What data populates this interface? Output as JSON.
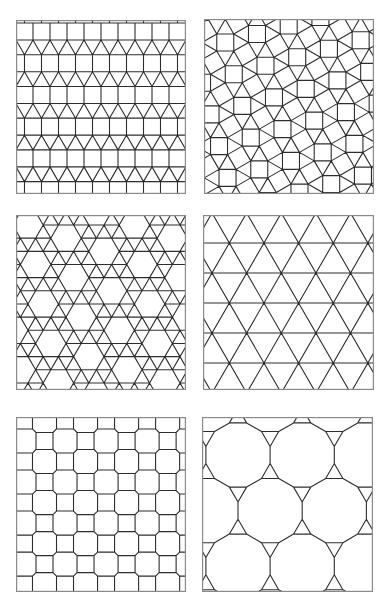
{
  "figure": {
    "background": "#ffffff",
    "line_color": "#2e2e2e",
    "frame_color": "#8a8a8a",
    "panels": [
      {
        "id": "elongated-triangular",
        "name": "Elongated triangular tiling (3.3.3.4.4)",
        "box": {
          "x": 16,
          "y": 20,
          "w": 170,
          "h": 174
        },
        "tiling": "elongated_triangular",
        "params": {
          "edge": 17,
          "origin_x": 0,
          "origin_y": 3
        }
      },
      {
        "id": "snub-square",
        "name": "Snub square tiling (3.3.4.3.4)",
        "box": {
          "x": 204,
          "y": 19,
          "w": 170,
          "h": 175
        },
        "tiling": "snub_square",
        "params": {
          "edge": 17,
          "rotation_deg": -15,
          "origin_x": 40,
          "origin_y": 42
        }
      },
      {
        "id": "snub-hexagonal",
        "name": "Snub hexagonal tiling (3.3.3.3.6)",
        "box": {
          "x": 16,
          "y": 215,
          "w": 170,
          "h": 175
        },
        "tiling": "snub_hexagonal",
        "params": {
          "edge": 15.2,
          "rotation_deg": 0,
          "origin_x": 12,
          "origin_y": 10
        }
      },
      {
        "id": "trihexagonal",
        "name": "Trihexagonal tiling (3.6.3.6)",
        "box": {
          "x": 203,
          "y": 215,
          "w": 171,
          "h": 175
        },
        "tiling": "trihexagonal",
        "params": {
          "row_spacing": 30,
          "origin_x": 9,
          "origin_y": 28
        }
      },
      {
        "id": "truncated-square",
        "name": "Truncated square tiling (4.8.8)",
        "box": {
          "x": 16,
          "y": 417,
          "w": 170,
          "h": 175
        },
        "tiling": "truncated_square",
        "params": {
          "edge": 17,
          "origin_x": 28.5,
          "origin_y": 24
        }
      },
      {
        "id": "truncated-hexagonal",
        "name": "Truncated hexagonal tiling (3.12.12)",
        "box": {
          "x": 202,
          "y": 417,
          "w": 171,
          "h": 175
        },
        "tiling": "truncated_hexagonal",
        "params": {
          "edge": 17.2,
          "origin_x": 36,
          "origin_y": 38
        }
      }
    ]
  }
}
